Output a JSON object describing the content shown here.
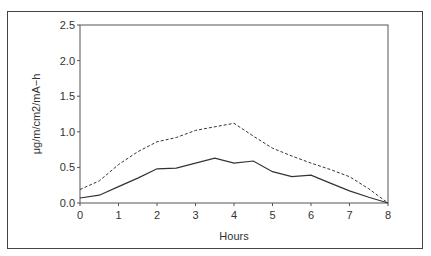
{
  "chart_data": {
    "type": "line",
    "title": "",
    "xlabel": "Hours",
    "ylabel": "μg/m/cm2/mA−h",
    "xlim": [
      0,
      8
    ],
    "ylim": [
      0,
      2.5
    ],
    "x_ticks": [
      "0",
      "1",
      "2",
      "3",
      "4",
      "5",
      "6",
      "7",
      "8"
    ],
    "y_ticks": [
      "0.0",
      "0.5",
      "1.0",
      "1.5",
      "2.0",
      "2.5"
    ],
    "grid": false,
    "legend": null,
    "x": [
      0,
      0.5,
      1,
      1.5,
      2,
      2.5,
      3,
      3.5,
      4,
      4.5,
      5,
      5.5,
      6,
      6.5,
      7,
      7.5,
      8
    ],
    "series": [
      {
        "name": "solid",
        "style": "solid",
        "values": [
          0.07,
          0.11,
          0.23,
          0.35,
          0.48,
          0.49,
          0.56,
          0.63,
          0.56,
          0.59,
          0.44,
          0.37,
          0.39,
          0.28,
          0.17,
          0.08,
          0.0
        ]
      },
      {
        "name": "dashed",
        "style": "dashed",
        "values": [
          0.19,
          0.31,
          0.54,
          0.72,
          0.86,
          0.92,
          1.02,
          1.07,
          1.12,
          0.94,
          0.77,
          0.66,
          0.56,
          0.47,
          0.37,
          0.2,
          0.0
        ]
      }
    ]
  },
  "colors": {
    "line": "#333333",
    "axis": "#555555",
    "frame": "#444444"
  }
}
